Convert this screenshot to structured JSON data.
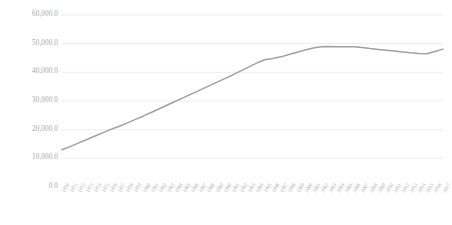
{
  "chart_data": {
    "type": "line",
    "title": "",
    "subtitle": "",
    "xlabel": "",
    "ylabel": "",
    "legend": [],
    "legend_position": "none",
    "grid": true,
    "grid_axis": "y",
    "ylim": [
      0,
      60000
    ],
    "ytick_labels": [
      "60,000.0",
      "50,000.0",
      "40,000.0",
      "30,000.0",
      "20,000.0",
      "10,000.0",
      "0.0"
    ],
    "ytick_values": [
      60000,
      50000,
      40000,
      30000,
      20000,
      10000,
      0
    ],
    "line_color": "#a0a0a0",
    "categories": [
      "1970",
      "1971",
      "1972",
      "1973",
      "1974",
      "1975",
      "1976",
      "1977",
      "1978",
      "1979",
      "1980",
      "1981",
      "1982",
      "1983",
      "1984",
      "1985",
      "1986",
      "1987",
      "1988",
      "1989",
      "1990",
      "1991",
      "1992",
      "1993",
      "1994",
      "1995",
      "1996",
      "1997",
      "1998",
      "1999",
      "2000",
      "2001",
      "2002",
      "2003",
      "2004",
      "2005",
      "2006",
      "2007",
      "2008",
      "2009",
      "2010",
      "2011",
      "2012",
      "2013",
      "2014",
      "2015",
      "2016",
      "2017"
    ],
    "series": [
      {
        "name": "Series 1",
        "values": [
          13000,
          14100,
          15300,
          16500,
          17700,
          18900,
          20100,
          21100,
          22300,
          23500,
          24700,
          26000,
          27300,
          28600,
          29900,
          31200,
          32500,
          33800,
          35100,
          36400,
          37700,
          39000,
          40400,
          41800,
          43200,
          44400,
          44800,
          45400,
          46200,
          47000,
          47800,
          48500,
          48900,
          49000,
          48900,
          48900,
          48900,
          48700,
          48300,
          48000,
          47700,
          47400,
          47100,
          46800,
          46600,
          46500,
          47300,
          48100
        ]
      }
    ]
  }
}
